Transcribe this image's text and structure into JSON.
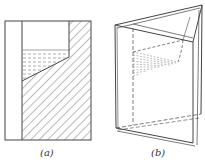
{
  "figure": {
    "panels": [
      {
        "id": "a",
        "label": "(a)",
        "description": "Front elevation of vessel with hatched solid and dashed water region"
      },
      {
        "id": "b",
        "label": "(b)",
        "description": "Perspective view of triangular prism vessel with dashed water surface"
      }
    ]
  }
}
